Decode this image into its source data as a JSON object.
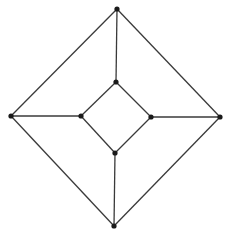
{
  "diagram": {
    "type": "graph",
    "colors": {
      "background": "#ffffff",
      "edge": "#3a3a3a",
      "node": "#1a1a1a"
    },
    "nodes": [
      {
        "id": "outer-top",
        "x": 117,
        "y": 9
      },
      {
        "id": "outer-right",
        "x": 220,
        "y": 117
      },
      {
        "id": "outer-bottom",
        "x": 114,
        "y": 226
      },
      {
        "id": "outer-left",
        "x": 11,
        "y": 116
      },
      {
        "id": "inner-top",
        "x": 116,
        "y": 82
      },
      {
        "id": "inner-right",
        "x": 151,
        "y": 117
      },
      {
        "id": "inner-bottom",
        "x": 115,
        "y": 153
      },
      {
        "id": "inner-left",
        "x": 81,
        "y": 116
      }
    ],
    "edges": [
      [
        "outer-top",
        "outer-right"
      ],
      [
        "outer-right",
        "outer-bottom"
      ],
      [
        "outer-bottom",
        "outer-left"
      ],
      [
        "outer-left",
        "outer-top"
      ],
      [
        "inner-top",
        "inner-right"
      ],
      [
        "inner-right",
        "inner-bottom"
      ],
      [
        "inner-bottom",
        "inner-left"
      ],
      [
        "inner-left",
        "inner-top"
      ],
      [
        "outer-top",
        "inner-top"
      ],
      [
        "outer-right",
        "inner-right"
      ],
      [
        "outer-bottom",
        "inner-bottom"
      ],
      [
        "outer-left",
        "inner-left"
      ]
    ]
  }
}
